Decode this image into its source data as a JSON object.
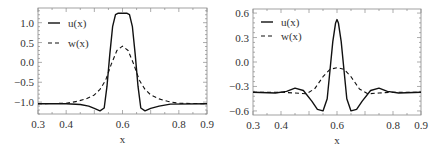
{
  "chart_data": [
    {
      "type": "line",
      "title": "",
      "xlabel": "x",
      "ylabel": "",
      "xlim": [
        0.3,
        0.9
      ],
      "ylim": [
        -1.3,
        1.37
      ],
      "xticks": [
        0.3,
        0.4,
        0.6,
        0.8,
        0.9
      ],
      "xtick_labels": [
        "0.3",
        "0.4",
        "0.6",
        "0.8",
        "0.9"
      ],
      "yticks": [
        1.0,
        0.5,
        0.0,
        -0.5,
        -1.0
      ],
      "ytick_labels": [
        "1.0",
        "0.5",
        "0.0",
        "−0.5",
        "−1.0"
      ],
      "grid": false,
      "legend": {
        "position": "upper-left",
        "entries": [
          "u(x)",
          "w(x)"
        ]
      },
      "series": [
        {
          "name": "u(x)",
          "style": "solid",
          "x": [
            0.3,
            0.4,
            0.45,
            0.48,
            0.5,
            0.52,
            0.535,
            0.545,
            0.555,
            0.565,
            0.575,
            0.585,
            0.6,
            0.615,
            0.625,
            0.635,
            0.645,
            0.655,
            0.665,
            0.68,
            0.7,
            0.73,
            0.77,
            0.9
          ],
          "y": [
            -1.04,
            -1.04,
            -1.06,
            -1.1,
            -1.16,
            -1.22,
            -1.15,
            -0.6,
            0.2,
            0.9,
            1.2,
            1.24,
            1.24,
            1.24,
            1.2,
            0.9,
            0.2,
            -0.6,
            -1.15,
            -1.22,
            -1.16,
            -1.1,
            -1.05,
            -1.04
          ]
        },
        {
          "name": "w(x)",
          "style": "dashed",
          "x": [
            0.3,
            0.4,
            0.44,
            0.47,
            0.5,
            0.52,
            0.54,
            0.56,
            0.58,
            0.6,
            0.62,
            0.64,
            0.66,
            0.68,
            0.7,
            0.73,
            0.76,
            0.8,
            0.9
          ],
          "y": [
            -1.04,
            -1.03,
            -0.98,
            -0.92,
            -0.82,
            -0.68,
            -0.45,
            -0.05,
            0.3,
            0.41,
            0.3,
            -0.05,
            -0.45,
            -0.68,
            -0.82,
            -0.92,
            -0.98,
            -1.03,
            -1.04
          ]
        }
      ]
    },
    {
      "type": "line",
      "title": "",
      "xlabel": "x",
      "ylabel": "",
      "xlim": [
        0.3,
        0.9
      ],
      "ylim": [
        -0.65,
        0.65
      ],
      "xticks": [
        0.3,
        0.4,
        0.6,
        0.8,
        0.9
      ],
      "xtick_labels": [
        "0.3",
        "0.4",
        "0.6",
        "0.8",
        "0.9"
      ],
      "yticks": [
        0.6,
        0.3,
        0.0,
        -0.3,
        -0.6
      ],
      "ytick_labels": [
        "0.6",
        "0.3",
        "0.0",
        "−0.3",
        "−0.6"
      ],
      "grid": false,
      "legend": {
        "position": "upper-left",
        "entries": [
          "u(x)",
          "w(x)"
        ]
      },
      "series": [
        {
          "name": "u(x)",
          "style": "solid",
          "x": [
            0.3,
            0.38,
            0.42,
            0.45,
            0.48,
            0.51,
            0.53,
            0.55,
            0.565,
            0.575,
            0.585,
            0.595,
            0.6,
            0.605,
            0.615,
            0.625,
            0.635,
            0.65,
            0.67,
            0.69,
            0.72,
            0.75,
            0.78,
            0.82,
            0.9
          ],
          "y": [
            -0.37,
            -0.38,
            -0.36,
            -0.32,
            -0.35,
            -0.48,
            -0.58,
            -0.6,
            -0.45,
            -0.1,
            0.25,
            0.48,
            0.52,
            0.48,
            0.25,
            -0.1,
            -0.45,
            -0.6,
            -0.58,
            -0.48,
            -0.35,
            -0.32,
            -0.36,
            -0.38,
            -0.37
          ]
        },
        {
          "name": "w(x)",
          "style": "dashed",
          "x": [
            0.3,
            0.4,
            0.45,
            0.49,
            0.52,
            0.55,
            0.575,
            0.6,
            0.625,
            0.65,
            0.68,
            0.71,
            0.75,
            0.8,
            0.9
          ],
          "y": [
            -0.37,
            -0.37,
            -0.38,
            -0.39,
            -0.33,
            -0.18,
            -0.09,
            -0.07,
            -0.09,
            -0.18,
            -0.33,
            -0.39,
            -0.38,
            -0.37,
            -0.37
          ]
        }
      ]
    }
  ],
  "panels": [
    {
      "frame": {
        "x0": 38,
        "y0": 8,
        "x1": 207,
        "y1": 114
      }
    },
    {
      "frame": {
        "x0": 253,
        "y0": 9,
        "x1": 421,
        "y1": 115
      }
    }
  ]
}
